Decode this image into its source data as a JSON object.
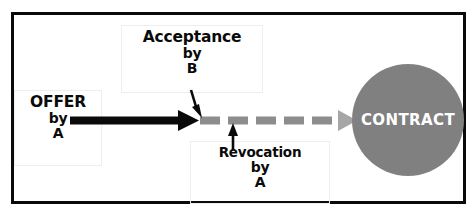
{
  "diagram": {
    "frame": {
      "name": "diagram-border",
      "color": "#0a0a0a"
    },
    "colors": {
      "ink": "#0a0a0a",
      "gray": "#808080",
      "box_border": "#ededf2",
      "circle_fill": "#808080",
      "circle_text": "#ffffff",
      "background": "#ffffff"
    },
    "nodes": [
      {
        "id": "offer",
        "name": "offer-box",
        "lines": [
          "OFFER",
          "by",
          "A"
        ],
        "line1": "OFFER",
        "line2": "by",
        "line3": "A"
      },
      {
        "id": "acceptance",
        "name": "acceptance-box",
        "lines": [
          "Acceptance",
          "by",
          "B"
        ],
        "line1": "Acceptance",
        "line2": "by",
        "line3": "B"
      },
      {
        "id": "revocation",
        "name": "revocation-box",
        "lines": [
          "Revocation",
          "by",
          "A"
        ],
        "line1": "Revocation",
        "line2": "by",
        "line3": "A"
      },
      {
        "id": "contract",
        "name": "contract-circle",
        "label": "CONTRACT",
        "shape": "circle",
        "fill": "#808080"
      }
    ],
    "connectors": [
      {
        "id": "offer-arrow",
        "name": "offer-solid-arrow",
        "style": "solid",
        "color": "#0a0a0a",
        "from": "offer",
        "to": "acceptance-point"
      },
      {
        "id": "contract-arrow",
        "name": "contract-dashed-arrow",
        "style": "dashed",
        "color": "#808080",
        "dash_count": 5,
        "from": "acceptance-point",
        "to": "contract"
      },
      {
        "id": "acceptance-pointer",
        "name": "acceptance-down-arrow",
        "style": "solid",
        "color": "#0a0a0a",
        "direction": "down"
      },
      {
        "id": "revocation-pointer",
        "name": "revocation-up-arrow",
        "style": "solid",
        "color": "#0a0a0a",
        "direction": "up"
      }
    ]
  }
}
